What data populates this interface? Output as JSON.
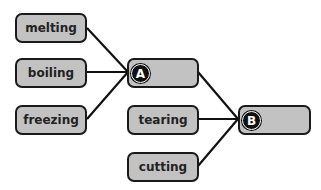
{
  "diagram": {
    "inputs_a": [
      {
        "id": "melting",
        "label": "melting"
      },
      {
        "id": "boiling",
        "label": "boiling"
      },
      {
        "id": "freezing",
        "label": "freezing"
      }
    ],
    "inputs_b": [
      {
        "id": "tearing",
        "label": "tearing"
      },
      {
        "id": "cutting",
        "label": "cutting"
      }
    ],
    "node_a": {
      "badge": "A",
      "label": ""
    },
    "node_b": {
      "badge": "B",
      "label": ""
    },
    "edges": [
      [
        "melting",
        "A"
      ],
      [
        "boiling",
        "A"
      ],
      [
        "freezing",
        "A"
      ],
      [
        "A",
        "B"
      ],
      [
        "tearing",
        "B"
      ],
      [
        "cutting",
        "B"
      ]
    ]
  }
}
